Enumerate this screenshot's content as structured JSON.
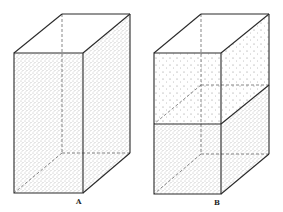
{
  "figure": {
    "panels": [
      {
        "id": "A",
        "label": "A",
        "description": "Rectangular box completely filled with stippled (dotted) material"
      },
      {
        "id": "B",
        "label": "B",
        "description": "Rectangular box with lower half densely stippled and upper half sparsely stippled, separated by a horizontal plane"
      }
    ]
  },
  "colors": {
    "line": "#2a2a2a",
    "dash": "#555555",
    "dense_fill": "#d9d9d9",
    "sparse_fill": "#f2f2f2",
    "background": "#ffffff"
  }
}
